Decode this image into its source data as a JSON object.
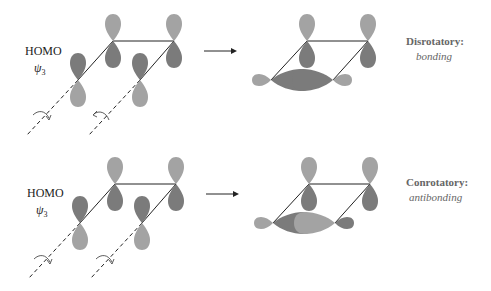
{
  "colors": {
    "light_lobe": "#a3a3a3",
    "dark_lobe": "#7b7b7b",
    "line": "#222222",
    "label_gray": "#666666",
    "background": "#ffffff"
  },
  "panels": [
    {
      "orbital_label": "HOMO",
      "wavefunction_symbol": "ψ",
      "wavefunction_subscript": "3",
      "reaction_arrow": "→",
      "mode_title": "Disrotatory:",
      "mode_result": "bonding",
      "rotation_left": "counterclockwise-down",
      "rotation_right": "clockwise-up"
    },
    {
      "orbital_label": "HOMO",
      "wavefunction_symbol": "ψ",
      "wavefunction_subscript": "3",
      "reaction_arrow": "→",
      "mode_title": "Conrotatory:",
      "mode_result": "antibonding",
      "rotation_left": "clockwise-down",
      "rotation_right": "clockwise-down"
    }
  ]
}
